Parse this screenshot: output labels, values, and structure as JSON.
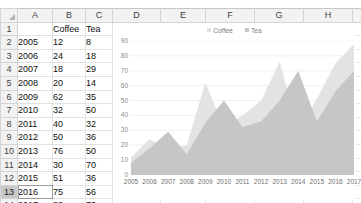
{
  "spreadsheet": {
    "column_headers": [
      "A",
      "B",
      "C",
      "D",
      "E",
      "F",
      "G",
      "H"
    ],
    "row_headers": [
      "1",
      "2",
      "3",
      "4",
      "5",
      "6",
      "7",
      "8",
      "9",
      "10",
      "11",
      "12",
      "13",
      "14"
    ],
    "active_row": "13",
    "active_cell": "A13",
    "header_row": {
      "a": "",
      "b": "Coffee",
      "c": "Tea"
    },
    "rows": [
      {
        "row": "2",
        "year": "2005",
        "coffee": "12",
        "tea": "8"
      },
      {
        "row": "3",
        "year": "2006",
        "coffee": "24",
        "tea": "18"
      },
      {
        "row": "4",
        "year": "2007",
        "coffee": "18",
        "tea": "29"
      },
      {
        "row": "5",
        "year": "2008",
        "coffee": "20",
        "tea": "14"
      },
      {
        "row": "6",
        "year": "2009",
        "coffee": "62",
        "tea": "35"
      },
      {
        "row": "7",
        "year": "2010",
        "coffee": "32",
        "tea": "50"
      },
      {
        "row": "8",
        "year": "2011",
        "coffee": "40",
        "tea": "32"
      },
      {
        "row": "9",
        "year": "2012",
        "coffee": "50",
        "tea": "36"
      },
      {
        "row": "10",
        "year": "2013",
        "coffee": "76",
        "tea": "50"
      },
      {
        "row": "11",
        "year": "2014",
        "coffee": "30",
        "tea": "70"
      },
      {
        "row": "12",
        "year": "2015",
        "coffee": "51",
        "tea": "36"
      },
      {
        "row": "13",
        "year": "2016",
        "coffee": "75",
        "tea": "56"
      },
      {
        "row": "14",
        "year": "2017",
        "coffee": "88",
        "tea": "70"
      }
    ]
  },
  "chart_data": {
    "type": "area",
    "title": "",
    "xlabel": "",
    "ylabel": "",
    "categories": [
      "2005",
      "2006",
      "2007",
      "2008",
      "2009",
      "2010",
      "2011",
      "2012",
      "2013",
      "2014",
      "2015",
      "2016",
      "2017"
    ],
    "series": [
      {
        "name": "Coffee",
        "values": [
          12,
          24,
          18,
          20,
          62,
          32,
          40,
          50,
          76,
          30,
          51,
          75,
          88
        ],
        "color": "#e3e3e3"
      },
      {
        "name": "Tea",
        "values": [
          8,
          18,
          29,
          14,
          35,
          50,
          32,
          36,
          50,
          70,
          36,
          56,
          70
        ],
        "color": "#c6c6c6"
      }
    ],
    "ylim": [
      0,
      90
    ],
    "yticks": [
      "0",
      "10",
      "20",
      "30",
      "40",
      "50",
      "60",
      "70",
      "80",
      "90"
    ],
    "grid": true,
    "stacked": false,
    "legend_position": "top"
  }
}
